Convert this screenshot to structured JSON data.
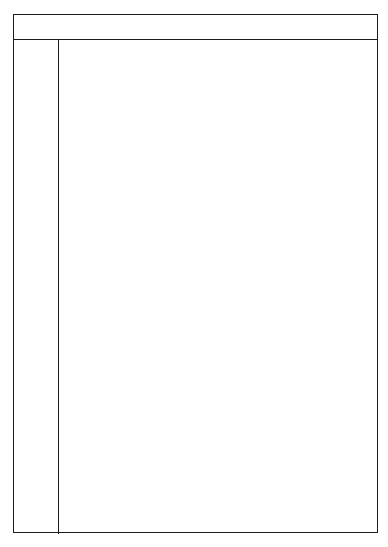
{
  "chart_data": {
    "type": "area",
    "xlabel": "",
    "ylabel": "",
    "grid": true,
    "legend_position": "none",
    "x_axis": {
      "label_pm": "P.M.",
      "label_am": "A.M.",
      "ticks": [
        "4",
        "5",
        "6",
        "7",
        "8",
        "9",
        "10",
        "11",
        "12",
        "1",
        "2",
        "3",
        "4",
        "5",
        "6",
        "7",
        "8"
      ],
      "pm_span": [
        "4",
        "5",
        "6",
        "7",
        "8",
        "9",
        "10",
        "11",
        "12"
      ],
      "am_span": [
        "1",
        "2",
        "3",
        "4",
        "5",
        "6",
        "7",
        "8"
      ]
    },
    "y_axis": {
      "months": [
        {
          "name": "JUL",
          "days": [
            "5",
            "12",
            "20",
            "28"
          ]
        },
        {
          "name": "AUG",
          "days": [
            "5",
            "12",
            "20",
            "28"
          ]
        },
        {
          "name": "SEP",
          "days": [
            "7",
            "14",
            "22",
            "30"
          ]
        },
        {
          "name": "OCT",
          "days": [
            "7",
            "14",
            "22",
            "30"
          ]
        },
        {
          "name": "NOV",
          "days": [
            "7",
            "14",
            "22",
            "29"
          ]
        },
        {
          "name": "DEC",
          "days": [
            "6",
            "14",
            "22",
            "29"
          ]
        },
        {
          "name": "JAN",
          "days": [
            "7",
            "14",
            "22",
            "29"
          ]
        },
        {
          "name": "FEB",
          "days": [
            "6",
            "13",
            "21",
            "28"
          ]
        },
        {
          "name": "MAR",
          "days": [
            "5",
            "13",
            "21",
            "28"
          ]
        },
        {
          "name": "APR",
          "days": [
            "6",
            "13",
            "21",
            "28"
          ]
        },
        {
          "name": "MAY",
          "days": [
            "6",
            "13",
            "21",
            "28"
          ]
        },
        {
          "name": "JUN",
          "days": [
            "6",
            "13",
            "21",
            "28"
          ]
        }
      ]
    },
    "regions": {
      "night_band_label": "night-shaded-band",
      "daylight_left_label": "DAYLIGHT",
      "daylight_right_label": "DAYLIGHT",
      "sunset_curve_label": "SUNSET",
      "sunrise_curve_label": "SUNRISE"
    },
    "diagonal_month_labels": [
      {
        "text": "APR",
        "x": 20,
        "y": 14,
        "rot": -42,
        "size": 9
      },
      {
        "text": "MAY",
        "x": 50,
        "y": 16,
        "rot": -42,
        "size": 9
      },
      {
        "text": "JUNE",
        "x": 82,
        "y": 18,
        "rot": -42,
        "size": 9
      },
      {
        "text": "JULY",
        "x": 120,
        "y": 17,
        "rot": -42,
        "size": 9
      },
      {
        "text": "AUGUST",
        "x": 140,
        "y": 44,
        "rot": -42,
        "size": 9
      },
      {
        "text": "SEPTEMBER",
        "x": 150,
        "y": 83,
        "rot": -42,
        "size": 9
      },
      {
        "text": "OCTOBER",
        "x": 152,
        "y": 131,
        "rot": -42,
        "size": 9
      },
      {
        "text": "NOVEMBER",
        "x": 142,
        "y": 175,
        "rot": -42,
        "size": 9
      },
      {
        "text": "DECEMBER",
        "x": 126,
        "y": 218,
        "rot": -42,
        "size": 9
      },
      {
        "text": "JANUARY",
        "x": 114,
        "y": 259,
        "rot": -42,
        "size": 9
      },
      {
        "text": "FEBRUARY",
        "x": 104,
        "y": 302,
        "rot": -42,
        "size": 9
      },
      {
        "text": "MARCH",
        "x": 99,
        "y": 344,
        "rot": -42,
        "size": 9
      },
      {
        "text": "APRIL",
        "x": 102,
        "y": 383,
        "rot": -42,
        "size": 9
      },
      {
        "text": "MAY",
        "x": 109,
        "y": 419,
        "rot": -42,
        "size": 9
      },
      {
        "text": "JUNE",
        "x": 115,
        "y": 451,
        "rot": -42,
        "size": 9
      },
      {
        "text": "JULY",
        "x": 136,
        "y": 469,
        "rot": -42,
        "size": 9
      },
      {
        "text": "AUGUST",
        "x": 168,
        "y": 466,
        "rot": -42,
        "size": 9
      },
      {
        "text": "SEPTEMBER",
        "x": 221,
        "y": 461,
        "rot": -42,
        "size": 9
      },
      {
        "text": "OCT",
        "x": 272,
        "y": 470,
        "rot": -42,
        "size": 9
      },
      {
        "text": "NOV",
        "x": 303,
        "y": 470,
        "rot": -42,
        "size": 9
      }
    ],
    "sunset_letters": [
      "S",
      "U",
      "N",
      "S",
      "E",
      "T"
    ],
    "sunrise_letters": [
      "S",
      "U",
      "N",
      "R",
      "I",
      "S",
      "E"
    ],
    "colors": {
      "band_fill": "#dcdcdc",
      "band_hatch": "#ffffff",
      "grid_minor": "#c9c9c9",
      "grid_major": "#6d6d6d",
      "border": "#1c1c1c",
      "text": "#111111",
      "curve_text": "#ffffff"
    }
  }
}
